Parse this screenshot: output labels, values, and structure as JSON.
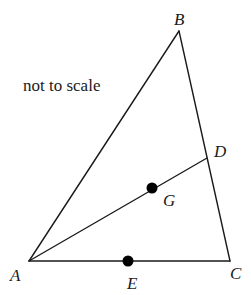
{
  "diagram": {
    "note": "not to scale",
    "points": {
      "A": {
        "label": "A",
        "x": 29,
        "y": 261
      },
      "B": {
        "label": "B",
        "x": 179,
        "y": 31
      },
      "C": {
        "label": "C",
        "x": 230,
        "y": 261
      },
      "D": {
        "label": "D",
        "x": 207,
        "y": 158
      },
      "G": {
        "label": "G",
        "x": 152,
        "y": 188
      },
      "E": {
        "label": "E",
        "x": 128,
        "y": 261
      }
    },
    "segments": [
      {
        "from": "A",
        "to": "B"
      },
      {
        "from": "B",
        "to": "C"
      },
      {
        "from": "A",
        "to": "C"
      },
      {
        "from": "A",
        "to": "D"
      }
    ],
    "marked_points": [
      "G",
      "E"
    ]
  }
}
